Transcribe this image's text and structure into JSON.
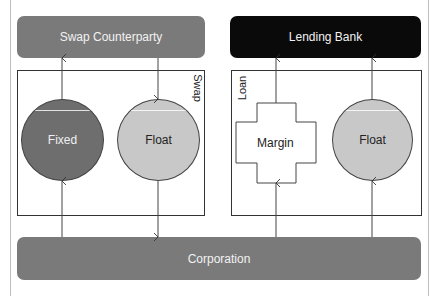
{
  "diagram": {
    "nodes": {
      "swap_counterparty": {
        "label": "Swap Counterparty",
        "fill": "#7a7a7a",
        "text_color": "#f0f0f0"
      },
      "lending_bank": {
        "label": "Lending Bank",
        "fill": "#0a0a0a",
        "text_color": "#f0f0f0"
      },
      "corporation": {
        "label": "Corporation",
        "fill": "#7a7a7a",
        "text_color": "#f0f0f0"
      }
    },
    "groups": {
      "swap": {
        "label": "Swap"
      },
      "loan": {
        "label": "Loan"
      }
    },
    "shapes": {
      "fixed": {
        "label": "Fixed",
        "shape": "circle",
        "fill": "#6e6e6e",
        "text_color": "#f0f0f0"
      },
      "swap_float": {
        "label": "Float",
        "shape": "circle",
        "fill": "#c8c8c8",
        "text_color": "#222222"
      },
      "margin": {
        "label": "Margin",
        "shape": "cross",
        "fill": "#ffffff",
        "text_color": "#222222"
      },
      "loan_float": {
        "label": "Float",
        "shape": "circle",
        "fill": "#c8c8c8",
        "text_color": "#222222"
      }
    },
    "edges": [
      {
        "from": "Corporation",
        "to": "Fixed"
      },
      {
        "from": "Fixed",
        "to": "Swap Counterparty"
      },
      {
        "from": "Swap Counterparty",
        "to": "Float (Swap)"
      },
      {
        "from": "Float (Swap)",
        "to": "Corporation"
      },
      {
        "from": "Corporation",
        "to": "Margin"
      },
      {
        "from": "Margin",
        "to": "Lending Bank"
      },
      {
        "from": "Corporation",
        "to": "Float (Loan)"
      },
      {
        "from": "Float (Loan)",
        "to": "Lending Bank"
      }
    ]
  }
}
